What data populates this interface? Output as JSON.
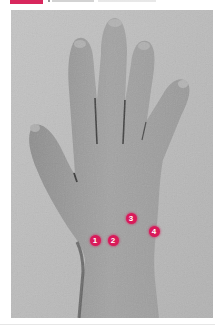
{
  "figure": {
    "label_color": "#d8275d",
    "marker_color": "#d81b5a",
    "markers": [
      {
        "number": "1",
        "x": 95,
        "y": 240
      },
      {
        "number": "2",
        "x": 113,
        "y": 240
      },
      {
        "number": "3",
        "x": 131,
        "y": 218
      },
      {
        "number": "4",
        "x": 154,
        "y": 231
      }
    ]
  }
}
